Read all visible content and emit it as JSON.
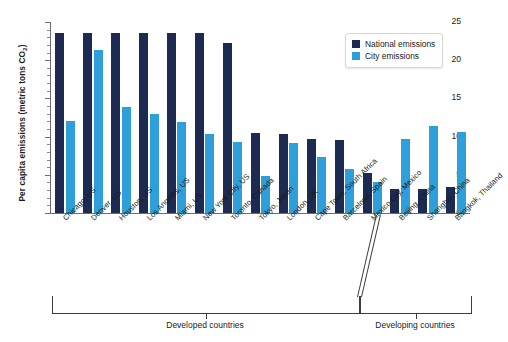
{
  "chart_data": {
    "type": "bar",
    "title": "",
    "xlabel": "",
    "ylabel": "Per capita emissions (metric tons CO2)",
    "ylabel_main": "Per capita emissions (metric tons CO",
    "ylabel_sub": "2",
    "ylabel_close": ")",
    "ylim": [
      0,
      25
    ],
    "ytick_labels": [
      "0",
      "5",
      "10",
      "15",
      "20",
      "25"
    ],
    "ytick_values": [
      0,
      5,
      10,
      15,
      20,
      25
    ],
    "minor_tick_step": 1,
    "grid": false,
    "legend_position": "top-right",
    "categories": [
      "Chicago, US",
      "Denver, US",
      "Houston, US",
      "Los Angeles, US",
      "Miami, US",
      "New York City, US",
      "Toronto, Canada",
      "Tokyo, Japan",
      "London, UK",
      "Cape Town, South Africa",
      "Barcelona, Spain",
      "Mexico City, Mexico",
      "Beijing, China",
      "Shanghai, China",
      "Bangkok, Thailand"
    ],
    "series": [
      {
        "name": "National emissions",
        "color": "#1d2a52",
        "values": [
          23.6,
          23.6,
          23.6,
          23.6,
          23.5,
          23.5,
          22.3,
          10.5,
          10.3,
          9.7,
          9.5,
          5.2,
          3.2,
          3.1,
          3.4
        ]
      },
      {
        "name": "City emissions",
        "color": "#2f9fdb",
        "values": [
          12.0,
          21.4,
          13.9,
          12.9,
          11.9,
          10.4,
          9.3,
          4.8,
          9.2,
          7.3,
          5.7,
          4.0,
          9.7,
          11.4,
          10.6
        ]
      }
    ],
    "annotations": [
      {
        "label": "Developed countries",
        "start_index": 0,
        "end_index": 10
      },
      {
        "label": "Developing countries",
        "start_index": 11,
        "end_index": 14
      }
    ]
  },
  "legend": {
    "items": [
      {
        "label": "National emissions",
        "color": "#1d2a52"
      },
      {
        "label": "City emissions",
        "color": "#2f9fdb"
      }
    ]
  }
}
